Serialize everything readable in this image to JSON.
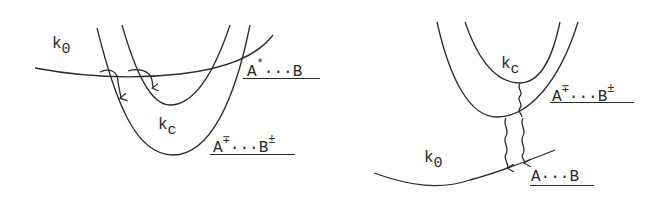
{
  "left_panel": {
    "k0_label": {
      "base": "k",
      "sub": "0"
    },
    "kc_label": {
      "base": "k",
      "sub": "c"
    },
    "state_upper": {
      "A": "A",
      "A_sup": "*",
      "dots": "···",
      "B": "B",
      "B_sup": ""
    },
    "state_lower": {
      "A": "A",
      "A_sup": "∓",
      "dots": "···",
      "B": "B",
      "B_sup": "±"
    }
  },
  "right_panel": {
    "kc_label": {
      "base": "k",
      "sub": "c"
    },
    "k0_label": {
      "base": "k",
      "sub": "0"
    },
    "state_upper": {
      "A": "A",
      "A_sup": "∓",
      "dots": "···",
      "B": "B",
      "B_sup": "±"
    },
    "state_lower": {
      "A": "A",
      "dots": "···",
      "B": "B"
    }
  },
  "colors": {
    "ink": "#2a2a2a",
    "background": "#ffffff"
  }
}
